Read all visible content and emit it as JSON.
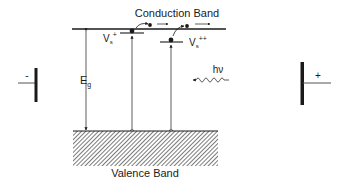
{
  "diagram": {
    "conduction_band": {
      "label": "Conduction Band"
    },
    "valence_band": {
      "label": "Valence Band"
    },
    "band_gap": {
      "label": "E",
      "subscript": "g"
    },
    "surface_states": [
      {
        "label": "V",
        "subscript": "s",
        "superscript": "+"
      },
      {
        "label": "V",
        "subscript": "s",
        "superscript": "++"
      }
    ],
    "photon": {
      "label": "hν"
    },
    "electrodes": {
      "negative": {
        "label": "-"
      },
      "positive": {
        "label": "+"
      }
    },
    "colors": {
      "line": "#1a1a1a",
      "thin_line": "#555555",
      "background": "#ffffff"
    }
  }
}
